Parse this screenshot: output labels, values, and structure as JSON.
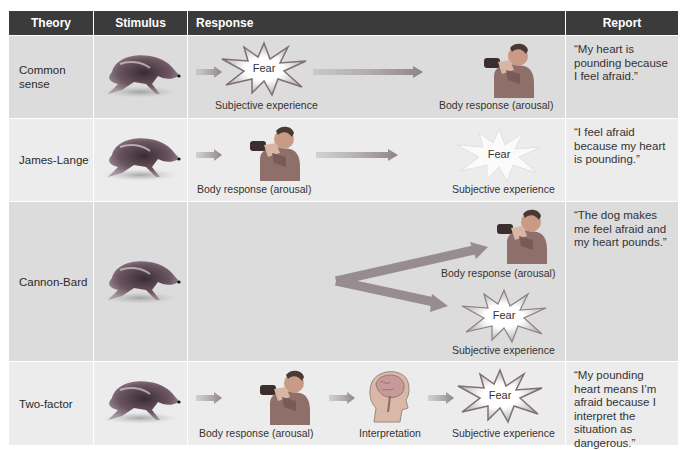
{
  "headers": {
    "theory": "Theory",
    "stimulus": "Stimulus",
    "response": "Response",
    "report": "Report"
  },
  "colors": {
    "header_bg": "#3b3b3b",
    "row_dark": "#dcdcdc",
    "row_light": "#ececec",
    "arrow": "#9a8f93",
    "starburst": "#ffffff"
  },
  "rows": [
    {
      "theory": "Common sense",
      "stimulus_icon": "running-dog",
      "response_steps": [
        {
          "icon": "fear-starburst",
          "icon_text": "Fear",
          "label": "Subjective experience"
        },
        {
          "icon": "arousal-man",
          "label": "Body response (arousal)"
        }
      ],
      "report": "“My heart is pounding because I feel afraid.”"
    },
    {
      "theory": "James-Lange",
      "stimulus_icon": "running-dog",
      "response_steps": [
        {
          "icon": "arousal-man",
          "label": "Body response (arousal)"
        },
        {
          "icon": "fear-starburst",
          "icon_text": "Fear",
          "label": "Subjective experience"
        }
      ],
      "report": "“I feel afraid because my heart is pounding.”"
    },
    {
      "theory": "Cannon-Bard",
      "stimulus_icon": "running-dog",
      "response_steps": [
        {
          "icon": "arousal-man",
          "label": "Body response (arousal)"
        },
        {
          "icon": "fear-starburst",
          "icon_text": "Fear",
          "label": "Subjective experience"
        }
      ],
      "report": "“The dog makes me feel afraid and my heart pounds.”"
    },
    {
      "theory": "Two-factor",
      "stimulus_icon": "running-dog",
      "response_steps": [
        {
          "icon": "arousal-man",
          "label": "Body response (arousal)"
        },
        {
          "icon": "brain-head",
          "label": "Interpretation"
        },
        {
          "icon": "fear-starburst",
          "icon_text": "Fear",
          "label": "Subjective experience"
        }
      ],
      "report": "“My pounding heart means I’m afraid because I interpret the situation as dangerous.”"
    }
  ]
}
